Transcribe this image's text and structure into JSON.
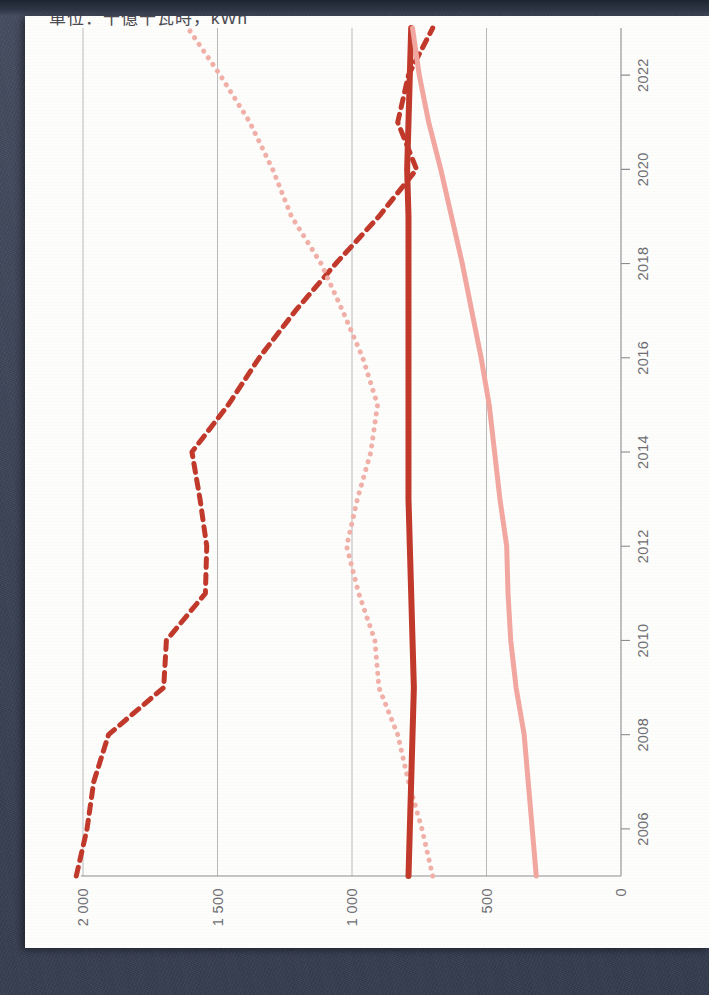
{
  "page": {
    "background_color": "#3c4557",
    "paper_color": "#fdfdfc"
  },
  "chart_data": {
    "type": "line",
    "title": "單位：十億千瓦時，kWh",
    "xlabel": "",
    "ylabel": "",
    "orientation": "rotated-90",
    "grid": true,
    "legend_position": "none",
    "xlim": [
      2005,
      2023
    ],
    "ylim": [
      0,
      2000
    ],
    "yticks": [
      0,
      500,
      1000,
      1500,
      2000
    ],
    "ytick_labels": [
      "0",
      "500",
      "1 000",
      "1 500",
      "2 000"
    ],
    "xticks": [
      2006,
      2008,
      2010,
      2012,
      2014,
      2016,
      2018,
      2020,
      2022
    ],
    "xtick_labels": [
      "2006",
      "2008",
      "2010",
      "2012",
      "2014",
      "2016",
      "2018",
      "2020",
      "2022"
    ],
    "x": [
      2005,
      2006,
      2007,
      2008,
      2009,
      2010,
      2011,
      2012,
      2013,
      2014,
      2015,
      2016,
      2017,
      2018,
      2019,
      2020,
      2021,
      2022,
      2023
    ],
    "series": [
      {
        "name": "series-dashed-dark",
        "color": "#c0392b",
        "style": "dashed",
        "width": 5,
        "values": [
          2025,
          1985,
          1960,
          1905,
          1700,
          1690,
          1545,
          1540,
          1565,
          1595,
          1460,
          1345,
          1210,
          1060,
          900,
          760,
          830,
          790,
          700
        ]
      },
      {
        "name": "series-dotted-light",
        "color": "#f0b0a8",
        "style": "dotted",
        "width": 5,
        "values": [
          700,
          740,
          790,
          830,
          900,
          915,
          975,
          1020,
          980,
          930,
          905,
          960,
          1035,
          1115,
          1225,
          1295,
          1380,
          1490,
          1610
        ]
      },
      {
        "name": "series-solid-dark",
        "color": "#c0392b",
        "style": "solid",
        "width": 6,
        "values": [
          790,
          785,
          780,
          775,
          770,
          775,
          780,
          785,
          790,
          790,
          790,
          790,
          790,
          790,
          790,
          795,
          790,
          785,
          780
        ]
      },
      {
        "name": "series-solid-light",
        "color": "#f2a6a0",
        "style": "solid",
        "width": 5,
        "values": [
          315,
          330,
          345,
          360,
          390,
          410,
          420,
          425,
          450,
          470,
          490,
          520,
          555,
          590,
          630,
          670,
          715,
          750,
          775
        ]
      }
    ]
  }
}
